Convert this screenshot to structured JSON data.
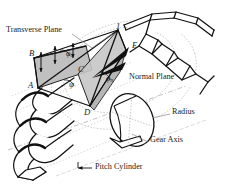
{
  "figure": {
    "title_type": "technical-line-diagram",
    "background_color": "#ffffff",
    "line_color": "#111111",
    "shade_color": "#b9b9b9",
    "dash_color": "#9a9a9a"
  },
  "callouts": [
    {
      "id": "transverse-plane",
      "label": "Transverse Plane",
      "x": 6,
      "y": 30,
      "leader": true
    },
    {
      "id": "normal-plane",
      "label": "Normal Plane",
      "x": 129,
      "y": 77,
      "leader": false
    },
    {
      "id": "radius",
      "label": "Radius",
      "x": 172,
      "y": 112,
      "leader": true
    },
    {
      "id": "gear-axis",
      "label": "Gear Axis",
      "x": 150,
      "y": 140,
      "leader": true
    },
    {
      "id": "pitch-cylinder",
      "label": "Pitch Cylinder",
      "x": 95,
      "y": 166,
      "leader": true
    }
  ],
  "vertices": [
    {
      "id": "point-1",
      "label": "1",
      "x": 116,
      "y": 26
    },
    {
      "id": "point-B",
      "label": "B",
      "x": 29,
      "y": 53
    },
    {
      "id": "point-E",
      "label": "E",
      "x": 132,
      "y": 45
    },
    {
      "id": "point-C",
      "label": "C",
      "x": 78,
      "y": 69
    },
    {
      "id": "point-A",
      "label": "A",
      "x": 28,
      "y": 85
    },
    {
      "id": "point-D",
      "label": "D",
      "x": 84,
      "y": 112
    }
  ],
  "angles": [
    {
      "id": "phi-t",
      "symbol": "φ",
      "subscript": "t",
      "x": 66,
      "y": 53,
      "meaning": "transverse pressure angle"
    },
    {
      "id": "phi-n",
      "symbol": "φ",
      "subscript": "n",
      "x": 106,
      "y": 78,
      "meaning": "normal pressure angle"
    },
    {
      "id": "psi",
      "symbol": "ψ",
      "subscript": "",
      "x": 69,
      "y": 84,
      "meaning": "helix angle"
    }
  ]
}
